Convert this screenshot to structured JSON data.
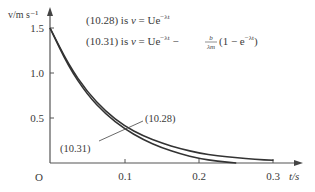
{
  "chart_data": {
    "type": "line",
    "title": "",
    "xlabel": "t/s",
    "ylabel": "v/m s⁻¹",
    "origin_label": "O",
    "xlim": [
      0,
      0.33
    ],
    "ylim": [
      0,
      1.7
    ],
    "grid": false,
    "x_ticks": [
      0.1,
      0.2,
      0.3
    ],
    "x_tick_labels": [
      "0.1",
      "0.2",
      "0.3"
    ],
    "y_ticks": [
      0.5,
      1.0,
      1.5
    ],
    "y_tick_labels": [
      "0.5",
      "1.0",
      "1.5"
    ],
    "annotations": [
      {
        "text": "(10.28) is v = Ue⁻ᵏᵗ"
      },
      {
        "text": "(10.31) is v = Ue⁻ᵏᵗ − b/(λm)(1 − e⁻ᵏᵗ)"
      }
    ],
    "series": [
      {
        "name": "(10.28)",
        "x": [
          0,
          0.025,
          0.05,
          0.075,
          0.1,
          0.125,
          0.15,
          0.175,
          0.2,
          0.225,
          0.25,
          0.275,
          0.3
        ],
        "values": [
          1.5,
          1.09,
          0.79,
          0.57,
          0.41,
          0.3,
          0.22,
          0.16,
          0.11,
          0.08,
          0.06,
          0.04,
          0.03
        ]
      },
      {
        "name": "(10.31)",
        "x": [
          0,
          0.025,
          0.05,
          0.075,
          0.1,
          0.125,
          0.15,
          0.175,
          0.2,
          0.225,
          0.25
        ],
        "values": [
          1.5,
          1.07,
          0.76,
          0.54,
          0.38,
          0.26,
          0.17,
          0.1,
          0.05,
          0.02,
          0.0
        ]
      }
    ]
  },
  "eq1": {
    "prefix": "(10.28) is ",
    "v": "v",
    "eq": " = Ue",
    "exp": "−λt"
  },
  "eq2": {
    "prefix": "(10.31) is ",
    "v": "v",
    "eq": " = Ue",
    "exp": "−λt",
    "minus": " − ",
    "frac_num": "b",
    "frac_den": "λm",
    "tail": "(1 − e",
    "tail_exp": "−λt",
    "close": ")"
  },
  "labels": {
    "curve1": "(10.28)",
    "curve2": "(10.31)"
  }
}
